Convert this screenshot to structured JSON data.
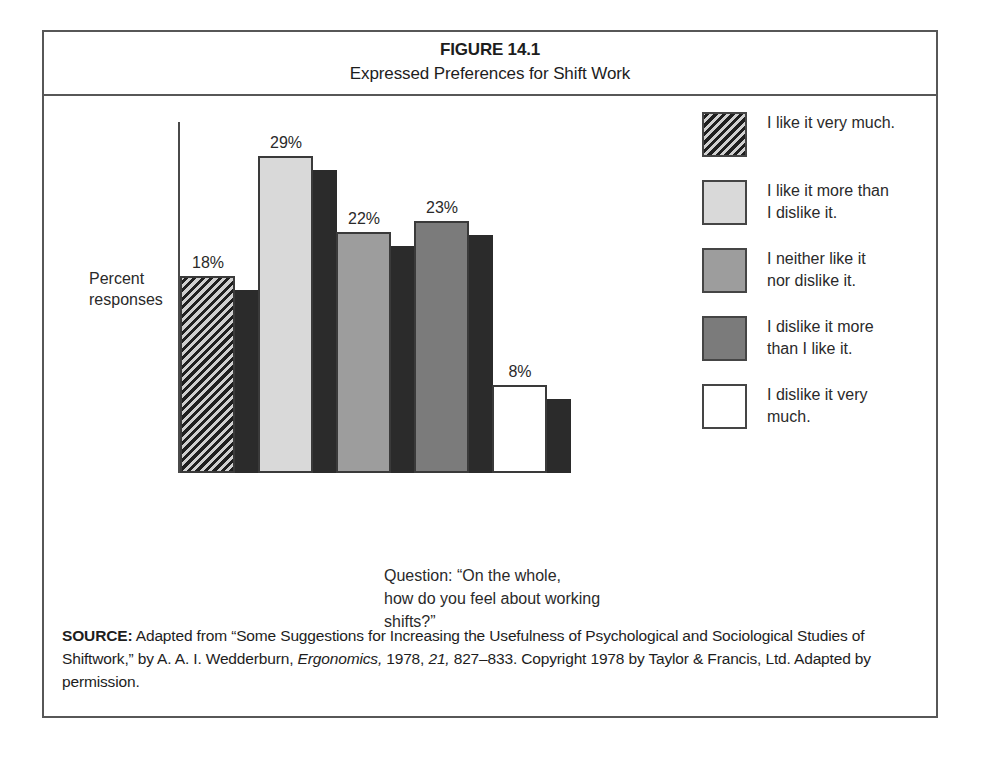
{
  "figure": {
    "number": "FIGURE 14.1",
    "title": "Expressed Preferences for Shift Work"
  },
  "chart_data": {
    "type": "bar",
    "title": "Expressed Preferences for Shift Work",
    "xlabel": "",
    "ylabel": "Percent responses",
    "ylim": [
      0,
      32
    ],
    "grid": false,
    "legend_position": "right",
    "value_labels": true,
    "categories": [
      "I like it very much.",
      "I like it more than I dislike it.",
      "I neither like it nor dislike it.",
      "I dislike it more than I like it.",
      "I dislike it very much."
    ],
    "values": [
      18,
      29,
      22,
      23,
      8
    ],
    "value_label_texts": [
      "18%",
      "29%",
      "22%",
      "23%",
      "8%"
    ],
    "bar_styles": [
      "diagonal-hatch-dark",
      "light-gray",
      "medium-gray",
      "dark-gray",
      "white"
    ],
    "annotation": "Question: “On the whole, how do you feel about working shifts?”"
  },
  "axis": {
    "y_label_line1": "Percent",
    "y_label_line2": "responses"
  },
  "bars": [
    {
      "value_label": "18%",
      "percent": 18,
      "fill_class": "fill-hatch",
      "swatch_name": "bar-1-like-very-much"
    },
    {
      "value_label": "29%",
      "percent": 29,
      "fill_class": "fill-light",
      "swatch_name": "bar-2-like-more-than-dislike"
    },
    {
      "value_label": "22%",
      "percent": 22,
      "fill_class": "fill-medium",
      "swatch_name": "bar-3-neither-like-nor-dislike"
    },
    {
      "value_label": "23%",
      "percent": 23,
      "fill_class": "fill-dark",
      "swatch_name": "bar-4-dislike-more-than-like"
    },
    {
      "value_label": "8%",
      "percent": 8,
      "fill_class": "fill-white",
      "swatch_name": "bar-5-dislike-very-much"
    }
  ],
  "legend": {
    "items": [
      {
        "label_line1": "I like it very much.",
        "label_line2": ""
      },
      {
        "label_line1": "I like it more than",
        "label_line2": "I dislike it."
      },
      {
        "label_line1": "I neither like it",
        "label_line2": "nor dislike it."
      },
      {
        "label_line1": "I dislike it more",
        "label_line2": "than I like it."
      },
      {
        "label_line1": "I dislike it very",
        "label_line2": "much."
      }
    ]
  },
  "question": {
    "line1": "Question: “On the whole,",
    "line2": "how do you feel about working",
    "line3": "shifts?”"
  },
  "source": {
    "label": "SOURCE:",
    "text_part1": " Adapted from “Some Suggestions for Increasing the Usefulness of Psychological and Sociological Studies of Shiftwork,” by A. A. I. Wedderburn, ",
    "journal": "Ergonomics,",
    "text_part2": " 1978, ",
    "volume": "21,",
    "text_part3": " 827–833. Copyright 1978 by Taylor & Francis, Ltd. Adapted by permission."
  },
  "colors": {
    "frame": "#575757",
    "axis": "#4a4a4a",
    "shadow": "#2b2b2b",
    "bar_hatch": "#1f1f1f",
    "bar_light": "#d9d9d9",
    "bar_medium": "#9d9d9d",
    "bar_dark": "#7b7b7b",
    "bar_white": "#ffffff",
    "text": "#1d1d1d"
  }
}
